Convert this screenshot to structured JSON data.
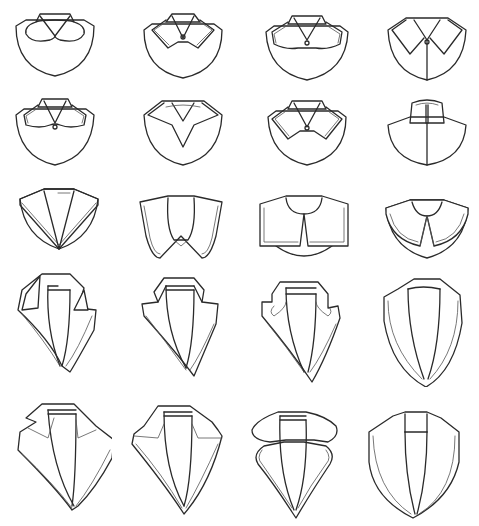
{
  "figure": {
    "title": "",
    "stroke_color": "#2a2a2a",
    "background": "#ffffff",
    "rows": [
      {
        "row": 1,
        "items": [
          "peter-pan-collar",
          "pointed-shirt-collar-with-button",
          "rounded-shirt-collar-with-button",
          "pointed-convertible-collar"
        ]
      },
      {
        "row": 2,
        "items": [
          "rounded-tab-shirt-collar-with-button",
          "pointed-flat-collar",
          "pointed-double-stitch-collar-with-button",
          "mandarin-stand-collar"
        ]
      },
      {
        "row": 3,
        "items": [
          "sailor-v-collar",
          "puritan-collar",
          "square-cape-collar",
          "deep-pointed-cape-collar"
        ]
      },
      {
        "row": 4,
        "items": [
          "notched-lapel",
          "peaked-notch-lapel",
          "rounded-notch-lapel",
          "shawl-lapel"
        ]
      },
      {
        "row": 5,
        "items": [
          "wide-notched-lapel",
          "wide-peaked-lapel",
          "clover-rounded-lapel",
          "wide-shawl-lapel"
        ]
      }
    ]
  }
}
